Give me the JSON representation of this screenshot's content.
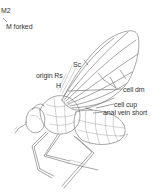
{
  "figure": {
    "labels": [
      {
        "id": "m2",
        "text": "M2",
        "x": 1,
        "y": 7
      },
      {
        "id": "m-forked",
        "text": "M forked",
        "x": 6,
        "y": 23
      },
      {
        "id": "sc",
        "text": "Sc",
        "x": 73,
        "y": 61
      },
      {
        "id": "origin-rs",
        "text": "origin Rs",
        "x": 36,
        "y": 72
      },
      {
        "id": "h",
        "text": "H",
        "x": 56,
        "y": 82
      },
      {
        "id": "cell-dm",
        "text": "cell dm",
        "x": 123,
        "y": 86
      },
      {
        "id": "cell-cup",
        "text": "cell cup",
        "x": 114,
        "y": 101
      },
      {
        "id": "anal-vein-short",
        "text": "anal vein short",
        "x": 103,
        "y": 109
      }
    ]
  }
}
